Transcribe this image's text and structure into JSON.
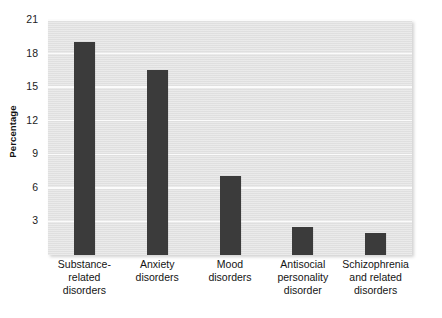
{
  "chart_data": {
    "type": "bar",
    "title": "",
    "subtitle": "",
    "xlabel": "",
    "ylabel": "Percentage",
    "categories": [
      "Substance-\nrelated\ndisorders",
      "Anxiety\ndisorders",
      "Mood\ndisorders",
      "Antisocial\npersonality\ndisorder",
      "Schizophrenia\nand related\ndisorders"
    ],
    "category_lines": [
      [
        "Substance-",
        "related",
        "disorders"
      ],
      [
        "Anxiety",
        "disorders"
      ],
      [
        "Mood",
        "disorders"
      ],
      [
        "Antisocial",
        "personality",
        "disorder"
      ],
      [
        "Schizophrenia",
        "and related",
        "disorders"
      ]
    ],
    "values": [
      19.0,
      16.5,
      7.1,
      2.5,
      2.0
    ],
    "ylim": [
      0,
      21
    ],
    "yticks": [
      3,
      6,
      9,
      12,
      15,
      18,
      21
    ],
    "ytick_labels": [
      "3",
      "6",
      "9",
      "12",
      "15",
      "18",
      "21"
    ],
    "grid": true,
    "grid_axis": "y",
    "legend": false,
    "legend_position": "none",
    "bar_color": "#3b3b3b",
    "plot_background": "#e2e2e2",
    "gridline_color": "#fbfbfb",
    "page_background": "#ffffff"
  },
  "axis": {
    "y_title": "Percentage"
  }
}
